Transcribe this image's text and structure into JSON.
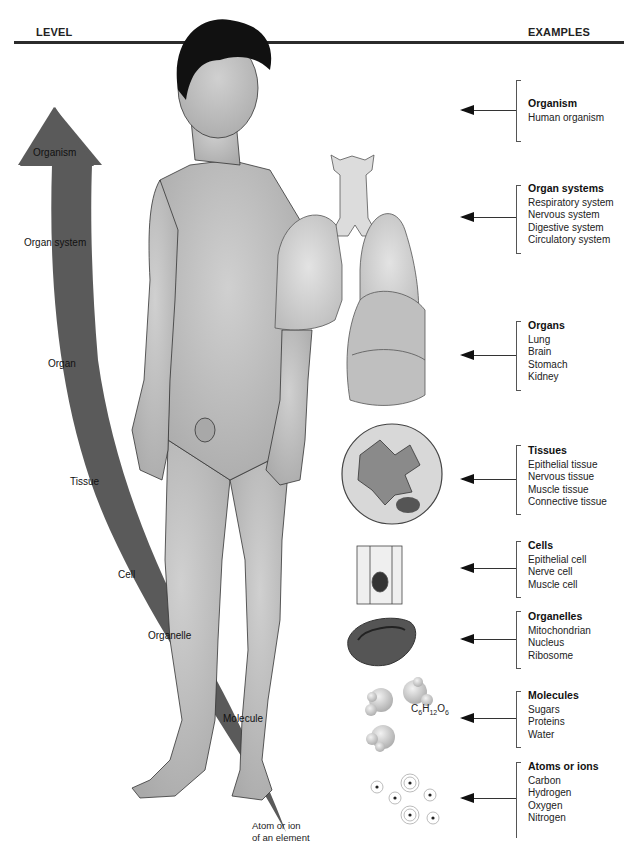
{
  "header": {
    "level_label": "LEVEL",
    "examples_label": "EXAMPLES"
  },
  "levels": [
    {
      "id": "organism",
      "label": "Organism"
    },
    {
      "id": "organ-system",
      "label": "Organ system"
    },
    {
      "id": "organ",
      "label": "Organ"
    },
    {
      "id": "tissue",
      "label": "Tissue"
    },
    {
      "id": "cell",
      "label": "Cell"
    },
    {
      "id": "organelle",
      "label": "Organelle"
    },
    {
      "id": "molecule",
      "label": "Molecule"
    },
    {
      "id": "atom",
      "label": "Atom or ion",
      "label2": "of an element"
    }
  ],
  "examples": [
    {
      "title": "Organism",
      "items": [
        "Human organism"
      ]
    },
    {
      "title": "Organ systems",
      "items": [
        "Respiratory system",
        "Nervous system",
        "Digestive system",
        "Circulatory system"
      ]
    },
    {
      "title": "Organs",
      "items": [
        "Lung",
        "Brain",
        "Stomach",
        "Kidney"
      ]
    },
    {
      "title": "Tissues",
      "items": [
        "Epithelial tissue",
        "Nervous tissue",
        "Muscle tissue",
        "Connective tissue"
      ]
    },
    {
      "title": "Cells",
      "items": [
        "Epithelial cell",
        "Nerve cell",
        "Muscle cell"
      ]
    },
    {
      "title": "Organelles",
      "items": [
        "Mitochondrian",
        "Nucleus",
        "Ribosome"
      ]
    },
    {
      "title": "Molecules",
      "items": [
        "Sugars",
        "Proteins",
        "Water"
      ]
    },
    {
      "title": "Atoms or ions",
      "items": [
        "Carbon",
        "Hydrogen",
        "Oxygen",
        "Nitrogen"
      ]
    }
  ],
  "formula": {
    "c": "C",
    "c_sub": "6",
    "h": "H",
    "h_sub": "12",
    "o": "O",
    "o_sub": "6"
  },
  "colors": {
    "level_arrow": "#5a5a5a",
    "skin": "#b4b4b4",
    "hair": "#111111",
    "rule": "#2b2b2b"
  }
}
